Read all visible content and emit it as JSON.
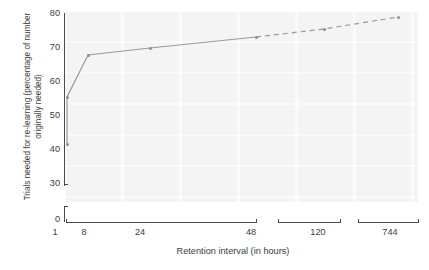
{
  "chart_data": {
    "type": "line",
    "title": "",
    "xlabel": "Retention interval (in hours)",
    "ylabel": "Trials needed for re-learning (percentage of number originally needed)",
    "x_tick_labels": [
      "1",
      "8",
      "24",
      "48",
      "120",
      "744"
    ],
    "x_scale": "broken-log-like categorical, axis broken after 48 and after 120",
    "y_tick_labels": [
      "80",
      "70",
      "60",
      "50",
      "40",
      "30",
      "0"
    ],
    "ylim": [
      30,
      80
    ],
    "y_axis_break": "axis broken between 30 and 0",
    "grid": false,
    "legend": "none",
    "series": [
      {
        "name": "Trials needed for re-learning",
        "line_color": "#9a9a9a",
        "marker": "small round",
        "points": [
          {
            "x_label": "1",
            "y": 41,
            "style": "solid",
            "note": "lower point at 1 hour (20 min equivalent start)"
          },
          {
            "x_label": "1",
            "y": 55,
            "style": "solid"
          },
          {
            "x_label": "8",
            "y": 66,
            "style": "solid"
          },
          {
            "x_label": "24",
            "y": 68,
            "style": "solid"
          },
          {
            "x_label": "48",
            "y": 71,
            "style": "solid"
          },
          {
            "x_label": "120",
            "y": 74,
            "style": "dashed"
          },
          {
            "x_label": "744",
            "y": 80,
            "style": "dashed"
          }
        ]
      }
    ],
    "annotations": [
      "line is solid up to the 48-hour point and dashed from 48 to 744"
    ]
  },
  "axes": {
    "y_ticks": [
      {
        "label": "80",
        "top": 8
      },
      {
        "label": "70",
        "top": 42
      },
      {
        "label": "60",
        "top": 76
      },
      {
        "label": "50",
        "top": 110
      },
      {
        "label": "40",
        "top": 144
      },
      {
        "label": "30",
        "top": 178
      },
      {
        "label": "0",
        "top": 214
      }
    ],
    "x_ticks": [
      {
        "label": "1",
        "left": 55
      },
      {
        "label": "8",
        "left": 84
      },
      {
        "label": "24",
        "left": 140
      },
      {
        "label": "48",
        "left": 251
      },
      {
        "label": "120",
        "left": 318
      },
      {
        "label": "744",
        "left": 390
      }
    ],
    "x_segments": [
      {
        "left": 66,
        "width": 190
      },
      {
        "left": 278,
        "width": 62
      },
      {
        "left": 358,
        "width": 60
      }
    ]
  }
}
